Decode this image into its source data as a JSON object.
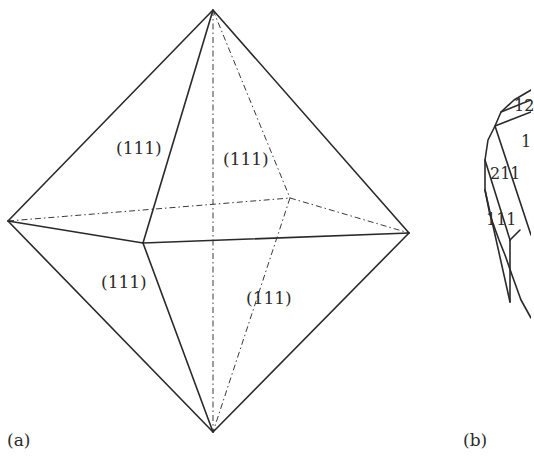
{
  "figure": {
    "panel_a": {
      "label": "(a)",
      "shape": "octahedron",
      "face_labels": [
        {
          "text": "(111)",
          "position": "upper-left-front"
        },
        {
          "text": "(111)",
          "position": "upper-right-back"
        },
        {
          "text": "(111)",
          "position": "lower-left-front"
        },
        {
          "text": "(111)",
          "position": "lower-right-front"
        }
      ],
      "vertices": {
        "top": [
          213,
          10
        ],
        "bottom": [
          213,
          432
        ],
        "left": [
          8,
          221
        ],
        "right": [
          409,
          233
        ],
        "front": [
          143,
          243
        ],
        "back": [
          290,
          198
        ],
        "back_center": [
          213,
          202
        ]
      }
    },
    "panel_b": {
      "label": "(b)",
      "shape": "truncated-crystal (partially cropped)",
      "face_labels": [
        {
          "text": "12"
        },
        {
          "text": "1"
        },
        {
          "text": "211"
        },
        {
          "text": "111"
        }
      ]
    },
    "colors": {
      "line": "#2a2a2a",
      "text": "#2b2b2b",
      "background": "#ffffff"
    }
  }
}
